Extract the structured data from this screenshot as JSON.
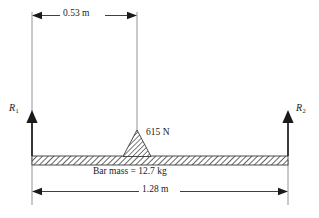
{
  "figure": {
    "background_color": "#ffffff",
    "line_color": "#3a3a3a",
    "hatch_color": "#555555"
  },
  "dimensions": {
    "top": {
      "label": "0.53 m",
      "value": 0.53,
      "unit": "m",
      "from": "left-support",
      "to": "fulcrum"
    },
    "bottom": {
      "label": "1.28 m",
      "value": 1.28,
      "unit": "m",
      "from": "left-support",
      "to": "right-support"
    }
  },
  "forces": {
    "reaction_left": {
      "symbol": "R",
      "subscript": "1",
      "direction": "up"
    },
    "reaction_right": {
      "symbol": "R",
      "subscript": "2",
      "direction": "up"
    },
    "point_load": {
      "label": "615 N",
      "value": 615,
      "unit": "N"
    }
  },
  "bar": {
    "mass_label": "Bar mass = 12.7 kg",
    "mass_value": 12.7,
    "mass_unit": "kg"
  }
}
